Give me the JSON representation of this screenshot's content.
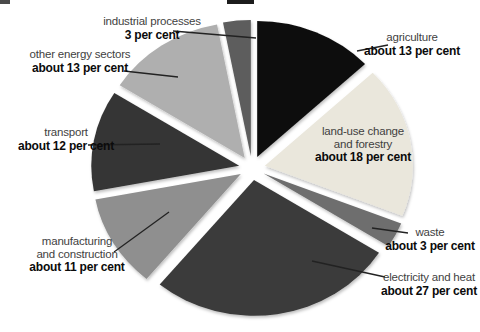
{
  "chart_data": {
    "type": "pie",
    "title": "",
    "legend": "none",
    "value_unit": "per cent",
    "slices": [
      {
        "key": "agriculture",
        "label_lines": [
          "agriculture"
        ],
        "value_label": "about 13 per cent",
        "value": 13,
        "color": "#111111",
        "label_pos": {
          "x": 412,
          "top": 31
        },
        "callout": {
          "x1": 388,
          "y1": 45,
          "x2": 357,
          "y2": 51
        }
      },
      {
        "key": "land-use-change-and-forestry",
        "label_lines": [
          "land-use change",
          "and forestry"
        ],
        "value_label": "about 18 per cent",
        "value": 18,
        "color": "#eae7dc",
        "label_pos": {
          "x": 363,
          "top": 125
        },
        "callout": null
      },
      {
        "key": "waste",
        "label_lines": [
          "waste"
        ],
        "value_label": "about 3 per cent",
        "value": 3,
        "color": "#6e6e6e",
        "label_pos": {
          "x": 430,
          "top": 226
        },
        "callout": {
          "x1": 408,
          "y1": 233,
          "x2": 372,
          "y2": 228
        }
      },
      {
        "key": "electricity-and-heat",
        "label_lines": [
          "electricity and heat"
        ],
        "value_label": "about 27 per cent",
        "value": 27,
        "color": "#3b3b3b",
        "label_pos": {
          "x": 429,
          "top": 271
        },
        "callout": {
          "x1": 385,
          "y1": 277,
          "x2": 312,
          "y2": 261
        }
      },
      {
        "key": "manufacturing-and-construction",
        "label_lines": [
          "manufacturing",
          "and construction"
        ],
        "value_label": "about 11 per cent",
        "value": 11,
        "color": "#8f8f8f",
        "label_pos": {
          "x": 77,
          "top": 235
        },
        "callout": {
          "x1": 114,
          "y1": 252,
          "x2": 169,
          "y2": 212
        }
      },
      {
        "key": "transport",
        "label_lines": [
          "transport"
        ],
        "value_label": "about 12 per cent",
        "value": 12,
        "color": "#343434",
        "label_pos": {
          "x": 66,
          "top": 126
        },
        "callout": {
          "x1": 88,
          "y1": 145,
          "x2": 160,
          "y2": 144
        }
      },
      {
        "key": "other-energy-sectors",
        "label_lines": [
          "other energy sectors"
        ],
        "value_label": "about 13 per cent",
        "value": 13,
        "color": "#afafaf",
        "label_pos": {
          "x": 80,
          "top": 48
        },
        "callout": {
          "x1": 124,
          "y1": 71,
          "x2": 178,
          "y2": 77
        }
      },
      {
        "key": "industrial-processes",
        "label_lines": [
          "industrial processes"
        ],
        "value_label": "3 per cent",
        "value": 3,
        "color": "#5d5d5d",
        "label_pos": {
          "x": 152,
          "top": 15
        },
        "callout": {
          "x1": 173,
          "y1": 31,
          "x2": 256,
          "y2": 38
        }
      }
    ],
    "layout": {
      "cx": 252,
      "cy": 168,
      "rx": 148,
      "ry": 136,
      "explode_x": 13,
      "explode_y": 12,
      "start_angle_deg": 0,
      "direction": "clockwise",
      "background": "#ffffff",
      "callout_color": "#222222",
      "name_color": "#3f3f3f",
      "value_color": "#0b0b0b"
    }
  },
  "scan_artifacts": [
    {
      "x": 0,
      "y": 0,
      "w": 10,
      "h": 4,
      "color": "#4a4a4a"
    },
    {
      "x": 227,
      "y": 0,
      "w": 27,
      "h": 4,
      "color": "#1c1c1c"
    }
  ]
}
